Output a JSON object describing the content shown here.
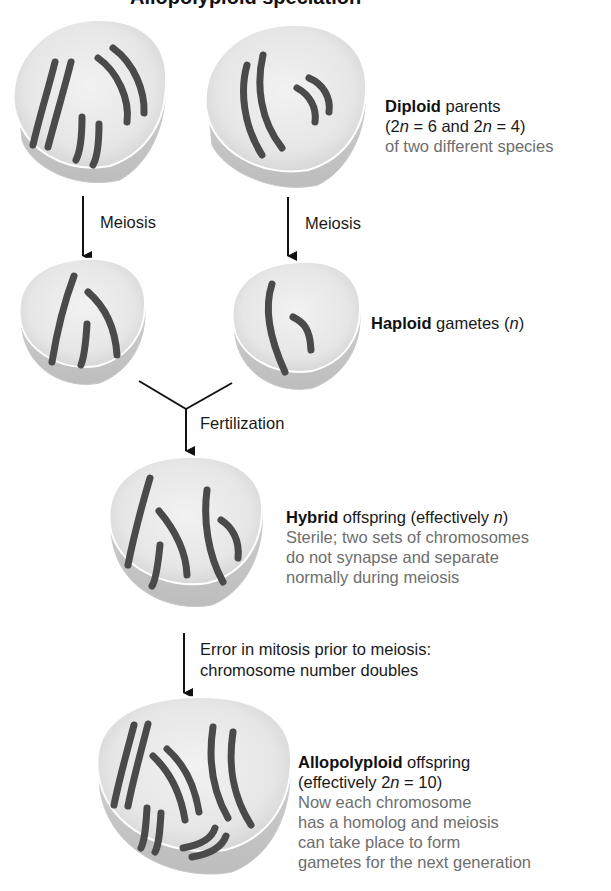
{
  "figure": {
    "title_clipped": "Allopolyploid speciation",
    "colors": {
      "cell_fill": "#ececec",
      "cell_rim": "#cfcfcf",
      "chromosome": "#4a4a4a",
      "arrow": "#111111",
      "caption_gray": "#6e6e6e"
    }
  },
  "steps": {
    "meiosis_left": "Meiosis",
    "meiosis_right": "Meiosis",
    "fertilization": "Fertilization",
    "error_line1": "Error in mitosis prior to meiosis:",
    "error_line2": "chromosome number doubles"
  },
  "captions": {
    "diploid": {
      "bold": "Diploid",
      "rest": " parents",
      "line2_pre": "(2",
      "line2_n1": "n",
      "line2_mid": " = 6 and 2",
      "line2_n2": "n",
      "line2_post": " = 4)",
      "line3": "of two different species"
    },
    "haploid": {
      "bold": "Haploid",
      "rest": " gametes (",
      "n": "n",
      "close": ")"
    },
    "hybrid": {
      "bold": "Hybrid",
      "rest": " offspring (effectively ",
      "n": "n",
      "close": ")",
      "line2": "Sterile; two sets of chromosomes",
      "line3": "do not synapse and separate",
      "line4": "normally during meiosis"
    },
    "allopolyploid": {
      "bold": "Allopolyploid",
      "rest": " offspring",
      "line2_pre": "(effectively 2",
      "line2_n": "n",
      "line2_post": " = 10)",
      "line3": "Now each chromosome",
      "line4": "has a homolog and meiosis",
      "line5": "can take place to form",
      "line6": "gametes for the next generation"
    }
  },
  "cells": [
    {
      "id": "parent-species-a",
      "chromosomes": 6
    },
    {
      "id": "parent-species-b",
      "chromosomes": 4
    },
    {
      "id": "gamete-a",
      "chromosomes": 3
    },
    {
      "id": "gamete-b",
      "chromosomes": 2
    },
    {
      "id": "hybrid",
      "chromosomes": 5
    },
    {
      "id": "allopolyploid",
      "chromosomes": 10
    }
  ]
}
